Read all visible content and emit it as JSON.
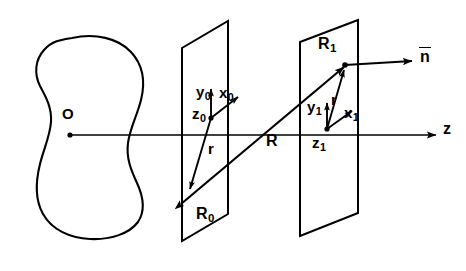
{
  "figure": {
    "type": "geometry-diagram",
    "background_color": "#ffffff",
    "stroke_color": "#000000"
  },
  "labels": {
    "origin": "O",
    "y0": "y",
    "y0_sub": "0",
    "x0": "x",
    "x0_sub": "0",
    "z0": "z",
    "z0_sub": "0",
    "r0": "r",
    "R0": "R",
    "R0_sub": "0",
    "R": "R",
    "R1": "R",
    "R1_sub": "1",
    "y1": "y",
    "y1_sub": "1",
    "r1": "r",
    "x1": "x",
    "x1_sub": "1",
    "z1": "z",
    "z1_sub": "1",
    "z_axis": "z",
    "normal": "n"
  },
  "geometry": {
    "blob": {
      "name": "scattering-object",
      "center_label": "O",
      "center_point": [
        70,
        135
      ]
    },
    "z_axis": {
      "start": [
        70,
        135
      ],
      "end": [
        438,
        135
      ],
      "arrow": true
    },
    "plane_0": {
      "name": "source-plane",
      "corners": [
        [
          182,
          48
        ],
        [
          228,
          21
        ],
        [
          228,
          214
        ],
        [
          182,
          241
        ]
      ],
      "origin_point": [
        211,
        118
      ]
    },
    "plane_1": {
      "name": "observation-plane",
      "corners": [
        [
          300,
          42
        ],
        [
          358,
          20
        ],
        [
          358,
          213
        ],
        [
          300,
          236
        ]
      ],
      "origin_point": [
        327,
        129
      ]
    },
    "vector_r0": {
      "from": [
        211,
        118
      ],
      "to": [
        190,
        190
      ]
    },
    "vector_R": {
      "from": [
        180,
        205
      ],
      "to": [
        345,
        66
      ],
      "double_headed": true
    },
    "vector_r1": {
      "from": [
        327,
        129
      ],
      "to": [
        345,
        68
      ]
    },
    "vector_y0": {
      "from": [
        211,
        118
      ],
      "to": [
        211,
        90
      ]
    },
    "vector_x0": {
      "from": [
        211,
        118
      ],
      "to": [
        239,
        96
      ]
    },
    "vector_y1": {
      "from": [
        327,
        129
      ],
      "to": [
        327,
        104
      ]
    },
    "vector_x1": {
      "from": [
        327,
        129
      ],
      "to": [
        352,
        112
      ]
    },
    "vector_n": {
      "from": [
        345,
        66
      ],
      "to": [
        414,
        61
      ]
    }
  }
}
